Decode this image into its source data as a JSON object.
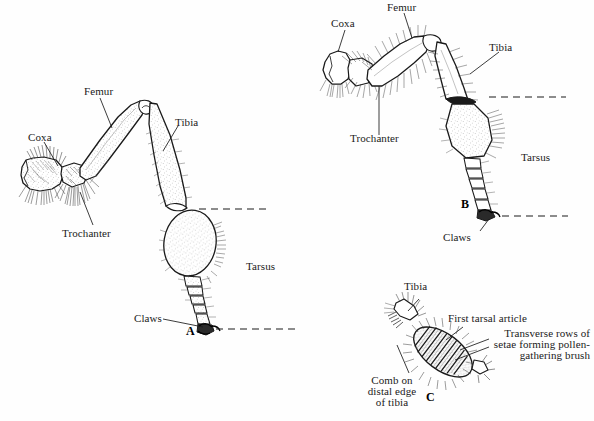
{
  "plate": {
    "title": "Bee hind leg anatomy plate",
    "background_color": "#fefefe",
    "ink_color": "#1a1a1a"
  },
  "figures": [
    {
      "id": "A",
      "marker": "A",
      "name": "figure-a-leg",
      "description": "Whole hind leg, lateral view, left side of plate",
      "labels": [
        {
          "text": "Coxa",
          "name": "label-coxa-a"
        },
        {
          "text": "Femur",
          "name": "label-femur-a"
        },
        {
          "text": "Tibia",
          "name": "label-tibia-a"
        },
        {
          "text": "Trochanter",
          "name": "label-trochanter-a"
        },
        {
          "text": "Tarsus",
          "name": "label-tarsus-a"
        },
        {
          "text": "Claws",
          "name": "label-claws-a"
        }
      ]
    },
    {
      "id": "B",
      "marker": "B",
      "name": "figure-b-leg",
      "description": "Whole hind leg, hairy form, upper right of plate",
      "labels": [
        {
          "text": "Coxa",
          "name": "label-coxa-b"
        },
        {
          "text": "Femur",
          "name": "label-femur-b"
        },
        {
          "text": "Tibia",
          "name": "label-tibia-b"
        },
        {
          "text": "Trochanter",
          "name": "label-trochanter-b"
        },
        {
          "text": "Tarsus",
          "name": "label-tarsus-b"
        },
        {
          "text": "Claws",
          "name": "label-claws-b"
        }
      ]
    },
    {
      "id": "C",
      "marker": "C",
      "name": "figure-c-detail",
      "description": "Detail of first tarsal article with pollen-gathering brush, lower right",
      "labels": [
        {
          "text": "Tibia",
          "name": "label-tibia-c"
        },
        {
          "text": "First tarsal article",
          "name": "label-first-tarsal-article"
        },
        {
          "text": "Transverse rows of",
          "name": "label-transverse-line1"
        },
        {
          "text": "setae forming pollen-",
          "name": "label-transverse-line2"
        },
        {
          "text": "gathering brush",
          "name": "label-transverse-line3"
        },
        {
          "text": "Comb on",
          "name": "label-comb-line1"
        },
        {
          "text": "distal edge",
          "name": "label-comb-line2"
        },
        {
          "text": "of tibia",
          "name": "label-comb-line3"
        }
      ]
    }
  ],
  "caption": {
    "text": ""
  }
}
